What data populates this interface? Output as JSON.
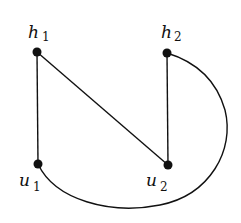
{
  "graph": {
    "nodes": [
      {
        "id": "h1",
        "name": "h",
        "sub": "1",
        "x": 37,
        "y": 52,
        "lx": 28,
        "ly": 38
      },
      {
        "id": "h2",
        "name": "h",
        "sub": "2",
        "x": 167,
        "y": 53,
        "lx": 161,
        "ly": 38
      },
      {
        "id": "u1",
        "name": "u",
        "sub": "1",
        "x": 38,
        "y": 164,
        "lx": 19,
        "ly": 188
      },
      {
        "id": "u2",
        "name": "u",
        "sub": "2",
        "x": 168,
        "y": 165,
        "lx": 146,
        "ly": 188
      }
    ],
    "edges": [
      {
        "from": "h1",
        "to": "u1",
        "type": "line"
      },
      {
        "from": "h1",
        "to": "u2",
        "type": "line"
      },
      {
        "from": "h2",
        "to": "u2",
        "type": "line"
      },
      {
        "from": "u1",
        "to": "h2",
        "type": "curve"
      }
    ],
    "labels": {
      "h1": "h",
      "h1_sub": "1",
      "h2": "h",
      "h2_sub": "2",
      "u1": "u",
      "u1_sub": "1",
      "u2": "u",
      "u2_sub": "2"
    }
  }
}
